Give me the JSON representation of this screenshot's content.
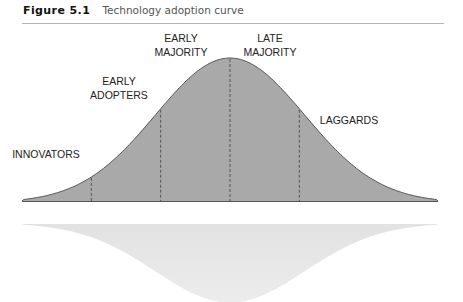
{
  "caption": {
    "figure_label": "Figure 5.1",
    "title": "Technology adoption curve"
  },
  "chart_data": {
    "type": "area",
    "title": "Technology adoption curve",
    "xlabel": "",
    "ylabel": "",
    "distribution": "normal (bell curve)",
    "segments": [
      {
        "name": "INNOVATORS",
        "lines": [
          "INNOVATORS"
        ],
        "from_sd": -3,
        "to_sd": -2
      },
      {
        "name": "EARLY ADOPTERS",
        "lines": [
          "EARLY",
          "ADOPTERS"
        ],
        "from_sd": -2,
        "to_sd": -1
      },
      {
        "name": "EARLY MAJORITY",
        "lines": [
          "EARLY",
          "MAJORITY"
        ],
        "from_sd": -1,
        "to_sd": 0
      },
      {
        "name": "LATE MAJORITY",
        "lines": [
          "LATE",
          "MAJORITY"
        ],
        "from_sd": 0,
        "to_sd": 1
      },
      {
        "name": "LAGGARDS",
        "lines": [
          "LAGGARDS"
        ],
        "from_sd": 1,
        "to_sd": 3
      }
    ],
    "dividers_sd": [
      -2,
      -1,
      0,
      1
    ],
    "xlim_sd": [
      -3,
      3
    ],
    "grid": false,
    "reflection": true,
    "colors": {
      "fill": "#a9a9a9",
      "stroke": "#555555",
      "reflection": "#e4e4e4",
      "divider": "#555555"
    }
  }
}
